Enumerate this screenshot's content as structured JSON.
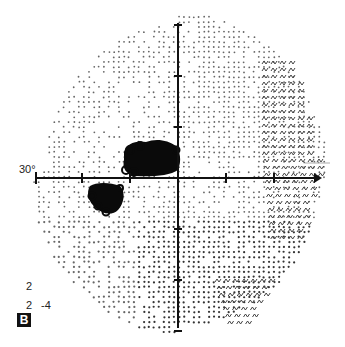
{
  "figure": {
    "panel_label": "B",
    "type": "visual-field-grayscale-plot",
    "axis_label": "30°",
    "legend": {
      "line1": "2",
      "line2_a": "2",
      "line2_b": "-4"
    },
    "colors": {
      "background": "#ffffff",
      "dots": "#555555",
      "scotoma": "#0a0a0a",
      "axes": "#111111"
    },
    "geometry": {
      "center": [
        178,
        178
      ],
      "horizontal_axis": [
        36,
        322
      ],
      "vertical_axis": [
        23,
        328
      ],
      "tick_spacing_px": 48
    },
    "regions": [
      {
        "name": "central-scotoma",
        "shape": "dense-black",
        "center": [
          153,
          158
        ]
      },
      {
        "name": "paracentral-scotoma",
        "shape": "dense-black",
        "center": [
          105,
          198
        ]
      },
      {
        "name": "temporal-superior-defect",
        "shape": "symbol-pattern",
        "center": [
          290,
          110
        ]
      },
      {
        "name": "inferior-nasal-defect",
        "shape": "symbol-pattern",
        "center": [
          245,
          290
        ]
      }
    ]
  }
}
